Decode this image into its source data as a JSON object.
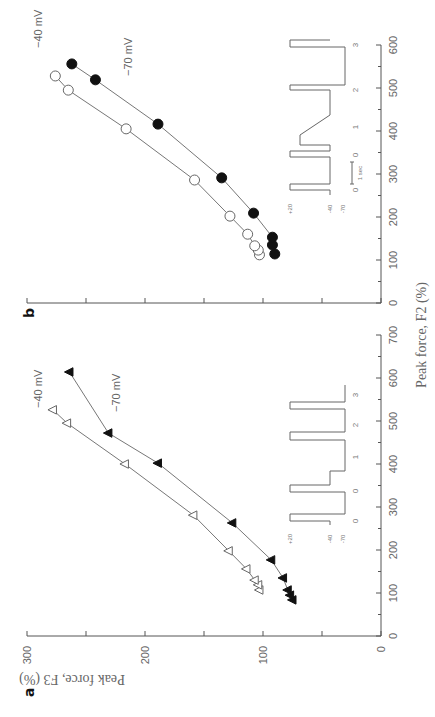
{
  "chart_data": [
    {
      "panel": "a",
      "type": "scatter",
      "xlabel": "Peak force, F2 (%)",
      "ylabel": "Peak force, F3 (%)",
      "xlim": [
        0,
        700
      ],
      "ylim": [
        0,
        300
      ],
      "xticks": [
        0,
        100,
        200,
        300,
        400,
        500,
        600,
        700
      ],
      "yticks": [
        0,
        100,
        200,
        300
      ],
      "series": [
        {
          "name": "-40 mV",
          "marker": "open-triangle",
          "x": [
            107,
            119,
            130,
            156,
            198,
            281,
            400,
            495,
            526
          ],
          "y": [
            103,
            104,
            107,
            114,
            129,
            159,
            217,
            266,
            278
          ]
        },
        {
          "name": "-70 mV",
          "marker": "filled-triangle",
          "x": [
            84,
            95,
            107,
            135,
            177,
            263,
            402,
            472,
            614
          ],
          "y": [
            75,
            77,
            79,
            83,
            93,
            126,
            189,
            231,
            264
          ]
        }
      ],
      "inset": {
        "levels": [
          "+20",
          "-40",
          "-70"
        ],
        "pulse_labels": [
          "0",
          "0",
          "1",
          "2",
          "3"
        ]
      }
    },
    {
      "panel": "b",
      "type": "scatter",
      "xlabel": "Peak force, F2 (%)",
      "ylabel": "Peak force, F3 (%)",
      "xlim": [
        0,
        600
      ],
      "ylim": [
        0,
        300
      ],
      "xticks": [
        0,
        100,
        200,
        300,
        400,
        500,
        600
      ],
      "yticks": [
        0,
        50,
        100,
        150,
        200,
        250,
        300
      ],
      "series": [
        {
          "name": "-40 mV",
          "marker": "open-circle",
          "x": [
            112,
            123,
            133,
            160,
            202,
            286,
            405,
            495,
            528
          ],
          "y": [
            103,
            104,
            107,
            113,
            128,
            158,
            216,
            265,
            276
          ]
        },
        {
          "name": "-70 mV",
          "marker": "filled-circle",
          "x": [
            114,
            135,
            153,
            209,
            291,
            416,
            519,
            556
          ],
          "y": [
            90,
            92,
            92,
            108,
            135,
            189,
            242,
            262
          ]
        }
      ],
      "inset": {
        "levels": [
          "+20",
          "-40",
          "-70"
        ],
        "pulse_labels": [
          "0",
          "0",
          "1",
          "2",
          "3"
        ],
        "scale_bar": "1 sec"
      }
    }
  ],
  "labels": {
    "panel_a": "a",
    "panel_b": "b",
    "xlabel": "Peak force, F2 (%)",
    "ylabel": "Peak force, F3 (%)",
    "series_a_40": "−40 mV",
    "series_a_70": "−70 mV",
    "series_b_40": "−40 mV",
    "series_b_70": "−70 mV"
  }
}
